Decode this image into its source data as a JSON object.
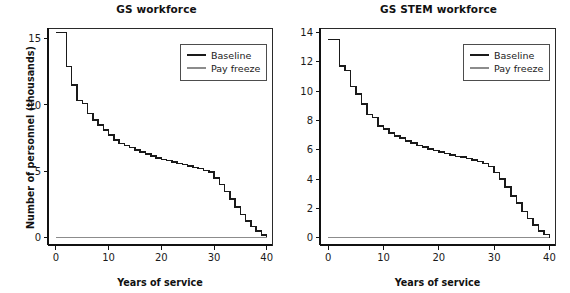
{
  "figure": {
    "background": "#ffffff",
    "panel_count": 2
  },
  "chart_data": [
    {
      "id": "gs-workforce",
      "type": "line",
      "style": "step",
      "title": "GS workforce",
      "xlabel": "Years of service",
      "ylabel": "Number of personnel (thousands)",
      "xlim": [
        -1.5,
        41
      ],
      "ylim": [
        -0.55,
        15.8
      ],
      "xticks": [
        0,
        10,
        20,
        30,
        40
      ],
      "xticklabels": [
        "0",
        "10",
        "20",
        "30",
        "40"
      ],
      "yticks": [
        0,
        5,
        10,
        15
      ],
      "yticklabels": [
        "0",
        "5",
        "10",
        "15"
      ],
      "grid": false,
      "legend": {
        "position": "upper right",
        "entries": [
          {
            "label": "Baseline",
            "color": "#1a1a1a"
          },
          {
            "label": "Pay freeze",
            "color": "#8c8c8c"
          }
        ]
      },
      "x": [
        0,
        1,
        2,
        3,
        4,
        5,
        6,
        7,
        8,
        9,
        10,
        11,
        12,
        13,
        14,
        15,
        16,
        17,
        18,
        19,
        20,
        21,
        22,
        23,
        24,
        25,
        26,
        27,
        28,
        29,
        30,
        31,
        32,
        33,
        34,
        35,
        36,
        37,
        38,
        39,
        40
      ],
      "series": [
        {
          "name": "Baseline",
          "color": "#1a1a1a",
          "values": [
            15.45,
            15.45,
            12.9,
            11.5,
            10.35,
            10.1,
            9.35,
            8.85,
            8.5,
            8.1,
            7.75,
            7.35,
            7.1,
            6.95,
            6.8,
            6.6,
            6.45,
            6.3,
            6.15,
            6.0,
            5.9,
            5.8,
            5.7,
            5.6,
            5.5,
            5.4,
            5.3,
            5.2,
            5.05,
            4.95,
            4.5,
            4.0,
            3.5,
            2.9,
            2.3,
            1.75,
            1.25,
            0.85,
            0.5,
            0.22,
            0.0
          ]
        },
        {
          "name": "Pay freeze",
          "color": "#8c8c8c",
          "values": [
            0,
            0,
            0,
            0,
            0,
            0,
            0,
            0,
            0,
            0,
            0,
            0,
            0,
            0,
            0,
            0,
            0,
            0,
            0,
            0,
            0,
            0,
            0,
            0,
            0,
            0,
            0,
            0,
            0,
            0,
            0,
            0,
            0,
            0,
            0,
            0,
            0,
            0,
            0,
            0,
            0
          ]
        }
      ]
    },
    {
      "id": "gs-stem-workforce",
      "type": "line",
      "style": "step",
      "title": "GS STEM workforce",
      "xlabel": "Years of service",
      "ylabel": "",
      "xlim": [
        -1.5,
        41
      ],
      "ylim": [
        -0.5,
        14.3
      ],
      "xticks": [
        0,
        10,
        20,
        30,
        40
      ],
      "xticklabels": [
        "0",
        "10",
        "20",
        "30",
        "40"
      ],
      "yticks": [
        0,
        2,
        4,
        6,
        8,
        10,
        12,
        14
      ],
      "yticklabels": [
        "0",
        "2",
        "4",
        "6",
        "8",
        "10",
        "12",
        "14"
      ],
      "grid": false,
      "legend": {
        "position": "upper right",
        "entries": [
          {
            "label": "Baseline",
            "color": "#1a1a1a"
          },
          {
            "label": "Pay freeze",
            "color": "#8c8c8c"
          }
        ]
      },
      "x": [
        0,
        1,
        2,
        3,
        4,
        5,
        6,
        7,
        8,
        9,
        10,
        11,
        12,
        13,
        14,
        15,
        16,
        17,
        18,
        19,
        20,
        21,
        22,
        23,
        24,
        25,
        26,
        27,
        28,
        29,
        30,
        31,
        32,
        33,
        34,
        35,
        36,
        37,
        38,
        39,
        40
      ],
      "series": [
        {
          "name": "Baseline",
          "color": "#1a1a1a",
          "values": [
            13.5,
            13.5,
            11.7,
            11.4,
            10.3,
            9.8,
            9.1,
            8.4,
            8.2,
            7.6,
            7.4,
            7.15,
            6.95,
            6.8,
            6.6,
            6.45,
            6.3,
            6.2,
            6.05,
            5.95,
            5.85,
            5.75,
            5.65,
            5.55,
            5.5,
            5.4,
            5.3,
            5.2,
            5.05,
            4.85,
            4.45,
            4.0,
            3.45,
            2.85,
            2.35,
            1.8,
            1.3,
            0.85,
            0.45,
            0.2,
            0.0
          ]
        },
        {
          "name": "Pay freeze",
          "color": "#8c8c8c",
          "values": [
            0,
            0,
            0,
            0,
            0,
            0,
            0,
            0,
            0,
            0,
            0,
            0,
            0,
            0,
            0,
            0,
            0,
            0,
            0,
            0,
            0,
            0,
            0,
            0,
            0,
            0,
            0,
            0,
            0,
            0,
            0,
            0,
            0,
            0,
            0,
            0,
            0,
            0,
            0,
            0,
            0
          ]
        }
      ]
    }
  ]
}
